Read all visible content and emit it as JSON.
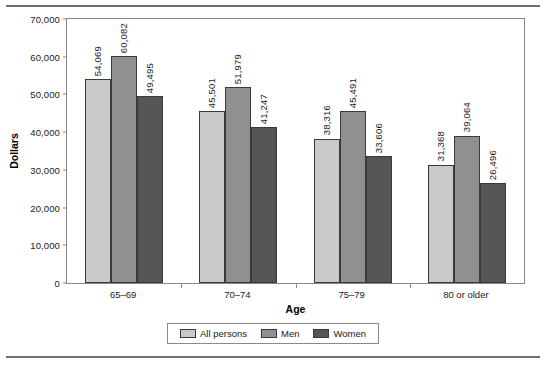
{
  "chart_data": {
    "type": "bar",
    "title": "",
    "xlabel": "Age",
    "ylabel": "Dollars",
    "ylim": [
      0,
      70000
    ],
    "yticks": [
      0,
      10000,
      20000,
      30000,
      40000,
      50000,
      60000,
      70000
    ],
    "ytick_labels": [
      "0",
      "10,000",
      "20,000",
      "30,000",
      "40,000",
      "50,000",
      "60,000",
      "70,000"
    ],
    "grid": false,
    "legend_position": "bottom",
    "categories": [
      "65–69",
      "70–74",
      "75–79",
      "80 or older"
    ],
    "series": [
      {
        "name": "All persons",
        "color": "#c9c9c9",
        "values": [
          54069,
          45501,
          38316,
          31368
        ],
        "labels": [
          "54,069",
          "45,501",
          "38,316",
          "31,368"
        ]
      },
      {
        "name": "Men",
        "color": "#909090",
        "values": [
          60082,
          51979,
          45491,
          39064
        ],
        "labels": [
          "60,082",
          "51,979",
          "45,491",
          "39,064"
        ]
      },
      {
        "name": "Women",
        "color": "#555555",
        "values": [
          49495,
          41247,
          33606,
          26496
        ],
        "labels": [
          "49,495",
          "41,247",
          "33,606",
          "26,496"
        ]
      }
    ]
  }
}
